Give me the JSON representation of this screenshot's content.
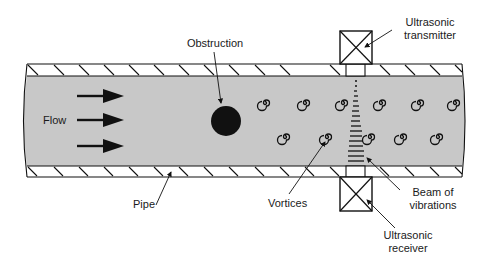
{
  "diagram": {
    "labels": {
      "obstruction": "Obstruction",
      "transmitter_line1": "Ultrasonic",
      "transmitter_line2": "transmitter",
      "flow": "Flow",
      "pipe": "Pipe",
      "vortices": "Vortices",
      "beam_line1": "Beam of",
      "beam_line2": "vibrations",
      "receiver_line1": "Ultrasonic",
      "receiver_line2": "receiver"
    },
    "colors": {
      "fluid": "#c8c8c8",
      "outline": "#111111",
      "background": "#ffffff"
    },
    "components": [
      "pipe",
      "flow-arrows",
      "obstruction",
      "vortices",
      "ultrasonic-transmitter",
      "ultrasonic-receiver",
      "beam-of-vibrations"
    ],
    "flow_arrow_count": 3,
    "vortex_rows": 2,
    "vortices_per_row": 6
  }
}
